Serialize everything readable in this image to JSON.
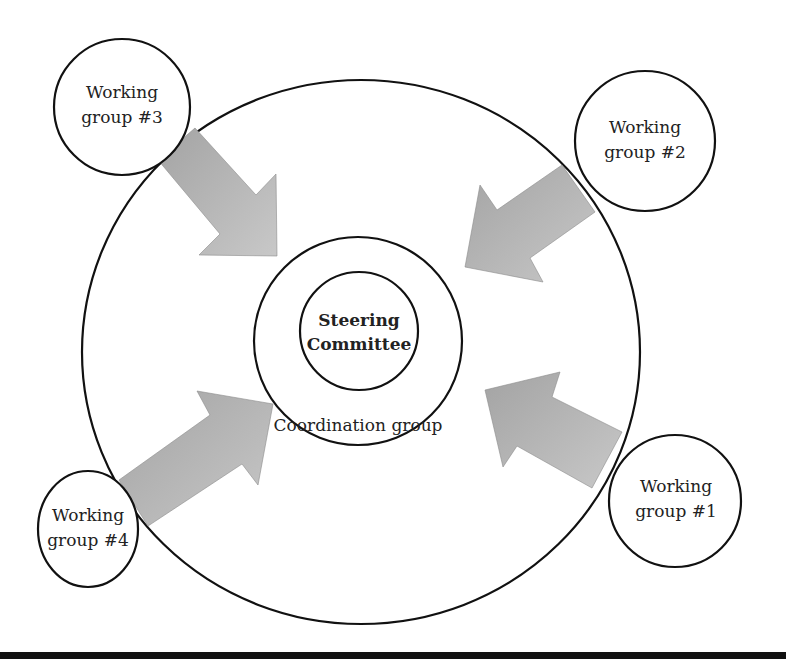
{
  "diagram": {
    "type": "concentric-organization-diagram",
    "center": {
      "steering": {
        "line1": "Steering",
        "line2": "Committee"
      },
      "coordination": {
        "label": "Coordination group"
      }
    },
    "working_groups": [
      {
        "id": 1,
        "line1": "Working",
        "line2": "group #1"
      },
      {
        "id": 2,
        "line1": "Working",
        "line2": "group #2"
      },
      {
        "id": 3,
        "line1": "Working",
        "line2": "group #3"
      },
      {
        "id": 4,
        "line1": "Working",
        "line2": "group #4"
      }
    ],
    "arrows": [
      {
        "from": "Working group #3",
        "to": "Coordination group",
        "direction": "down-right"
      },
      {
        "from": "Working group #2",
        "to": "Coordination group",
        "direction": "down-left"
      },
      {
        "from": "Working group #4",
        "to": "Coordination group",
        "direction": "up-right"
      },
      {
        "from": "Working group #1",
        "to": "Coordination group",
        "direction": "up-left"
      }
    ],
    "colors": {
      "stroke": "#111111",
      "arrow_fill_light": "#c4c4c4",
      "arrow_fill_dark": "#9a9a9a",
      "text": "#222222"
    }
  }
}
